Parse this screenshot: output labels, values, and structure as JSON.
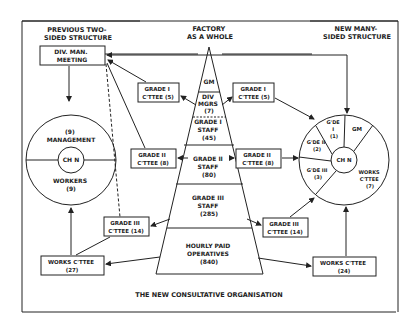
{
  "title": "THE NEW CONSULTATIVE ORGANISATION",
  "headers": {
    "left": [
      "PREVIOUS TWO-",
      "SIDED STRUCTURE"
    ],
    "center": [
      "FACTORY",
      "AS A WHOLE"
    ],
    "right": [
      "NEW MANY-",
      "SIDED STRUCTURE"
    ]
  },
  "pyramid": {
    "levels": [
      {
        "lines": [
          "GM"
        ]
      },
      {
        "lines": [
          "DIV",
          "MGRS",
          "(7)"
        ]
      },
      {
        "lines": [
          "GRADE I",
          "STAFF",
          "(45)"
        ]
      },
      {
        "lines": [
          "GRADE II",
          "STAFF",
          "(80)"
        ]
      },
      {
        "lines": [
          "GRADE III",
          "STAFF",
          "(285)"
        ]
      },
      {
        "lines": [
          "HOURLY PAID",
          "OPERATIVES",
          "(840)"
        ]
      }
    ]
  },
  "left": {
    "div_meeting": [
      "DIV. MAN.",
      "MEETING"
    ],
    "circle": {
      "top": [
        "(9)",
        "MANAGEMENT"
      ],
      "center": "CH N",
      "bottom": [
        "WORKERS",
        "(9)"
      ]
    },
    "grade1": [
      "GRADE I",
      "C'TTEE (5)"
    ],
    "grade2": [
      "GRADE II",
      "C'TTEE (8)"
    ],
    "grade3": [
      "GRADE III",
      "C'TTEE (14)"
    ],
    "works": [
      "WORKS C'TTEE",
      "(27)"
    ]
  },
  "right": {
    "grade1": [
      "GRADE I",
      "C'TTEE (5)"
    ],
    "grade2": [
      "GRADE II",
      "C'TTEE (8)"
    ],
    "grade3": [
      "GRADE III",
      "C'TTEE (14)"
    ],
    "works": [
      "WORKS C'TTEE",
      "(24)"
    ],
    "circle": {
      "center": "CH N",
      "gde1": [
        "G'DE",
        "I",
        "(1)"
      ],
      "gm": "GM",
      "gde2": [
        "G'DE II",
        "(2)"
      ],
      "gde3": [
        "G'DE III",
        "(3)"
      ],
      "works": [
        "WORKS",
        "C'TTEE",
        "(7)"
      ]
    }
  }
}
